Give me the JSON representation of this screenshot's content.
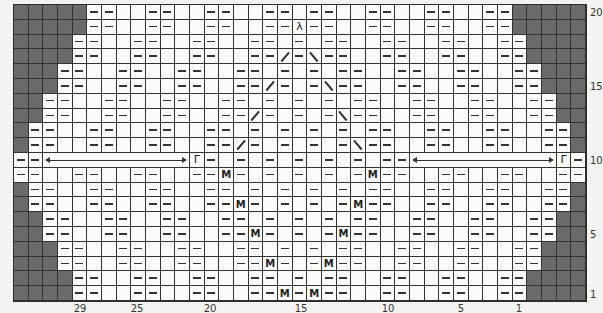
{
  "chart_data": {
    "type": "knitting-chart",
    "grid": {
      "columns": 39,
      "rows": 20
    },
    "colors": {
      "background": "#f3f3f1",
      "cell": "#fbfbfa",
      "dark": "#6a6a6a",
      "line": "#333333"
    },
    "legend_codes": {
      ".": "empty (knit)",
      "#": "no stitch (shaded)",
      "-": "purl",
      "M": "make one",
      "/": "right-slant decrease",
      "\\": "left-slant decrease",
      "^": "double decrease",
      "r": "r-symbol stitch",
      ">": "repeat arrow span"
    },
    "rows_top_to_bottom": [
      "#####--..--..--..--.--..--..--..--#####",
      "#####--..--..--..--^--..--..--..--#####",
      "####--..--..--..--.-.--..--..--..--####",
      "####--..--..--..--/-\\--..--..--..--####",
      "###--..--..--..--.-.-.--..--..--..--###",
      "###--..--..--..--/-.-\\--..--..--..--###",
      "##--..--..--..--.-.-.-.--..--..--..--##",
      "##--..--..--..--/-.-.-\\--..--..--..--##",
      "#--..--..--..--.-.-.-.-.--..--..--..--#",
      "#--..--..--..--/-.-.-.-\\--..--..--..--#",
      "-->>>>>>>>>>r-.-.-.-.-.-.-->>>>>>>>>>r-",
      "--..--..--..--M-.-.-.-.-M--..--..--..--",
      "#--..--..--..--.-.-.-.-.--..--..--..--#",
      "#--..--..--..--M-.-.-.-M--..--..--..--#",
      "##--..--..--..--.-.-.-.--..--..--..--##",
      "##--..--..--..--M-.-.-M--..--..--..--##",
      "###--..--..--..--.-.-.--..--..--..--###",
      "###--..--..--..--M-.-M--..--..--..--###",
      "####--..--..--..--.-.--..--..--..--####",
      "####--..--..--..--M-M--..--..--..--####"
    ],
    "row_labels": [
      {
        "text": "20",
        "row_index": 0
      },
      {
        "text": "15",
        "row_index": 5
      },
      {
        "text": "10",
        "row_index": 10
      },
      {
        "text": "5",
        "row_index": 15
      },
      {
        "text": "1",
        "row_index": 19
      }
    ],
    "column_labels": [
      {
        "text": "29",
        "x": 80
      },
      {
        "text": "25",
        "x": 137
      },
      {
        "text": "20",
        "x": 210
      },
      {
        "text": "15",
        "x": 301
      },
      {
        "text": "10",
        "x": 388
      },
      {
        "text": "5",
        "x": 461
      },
      {
        "text": "1",
        "x": 519
      }
    ],
    "glyphs": {
      "M": "M",
      "r": "Γ",
      "^": "λ"
    }
  }
}
